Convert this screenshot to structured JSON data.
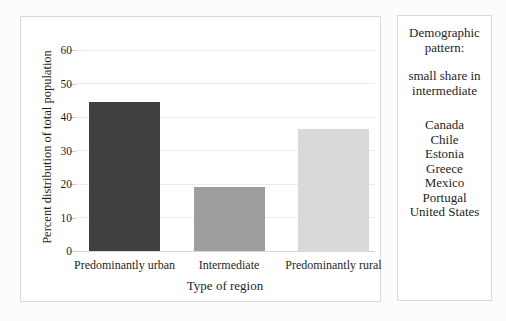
{
  "chart_data": {
    "type": "bar",
    "categories": [
      "Predominantly urban",
      "Intermediate",
      "Predominantly rural"
    ],
    "values": [
      44.5,
      19,
      36.5
    ],
    "bar_colors": [
      "#404040",
      "#9e9e9e",
      "#d9d9d9"
    ],
    "title": "",
    "xlabel": "Type of region",
    "ylabel": "Percent distribution of total population",
    "ylim": [
      0,
      60
    ],
    "yticks": [
      0,
      10,
      20,
      30,
      40,
      50,
      60
    ],
    "grid": true,
    "legend": "none"
  },
  "side_panel": {
    "title": "Demographic pattern:",
    "subtitle": "small share in intermediate",
    "countries": [
      "Canada",
      "Chile",
      "Estonia",
      "Greece",
      "Mexico",
      "Portugal",
      "United States"
    ]
  },
  "colors": {
    "chart_border": "#d9d9d9",
    "gridline": "#ececec",
    "axis_line": "#d6d6d6",
    "text": "#1f1f1f",
    "background": "#ffffff"
  }
}
